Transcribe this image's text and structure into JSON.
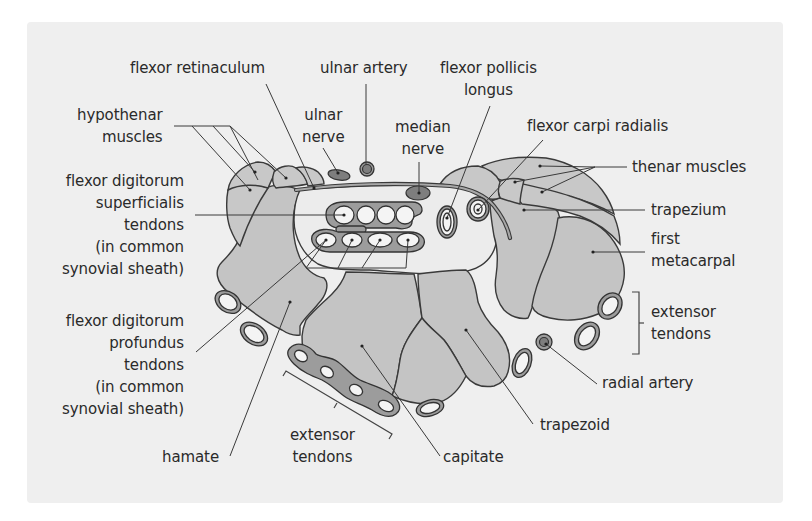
{
  "figure": {
    "colors": {
      "background": "#ffffff",
      "panel": "#efefef",
      "bone": "#c4c4c4",
      "tunnel_space": "#ececec",
      "sheath": "#9c9c9c",
      "nerve": "#7e7e7e",
      "outline": "#3a3a3a",
      "text": "#2a2a2a"
    }
  },
  "labels": {
    "flexor_retinaculum": "flexor retinaculum",
    "ulnar_artery": "ulnar artery",
    "flexor_pollicis_longus": "flexor pollicis\nlongus",
    "hypothenar_muscles": "hypothenar\nmuscles",
    "ulnar_nerve": "ulnar\nnerve",
    "median_nerve": "median\nnerve",
    "flexor_carpi_radialis": "flexor carpi radialis",
    "thenar_muscles": "thenar muscles",
    "fds_tendons": "flexor digitorum\nsuperficialis\ntendons\n(in common\nsynovial sheath)",
    "trapezium": "trapezium",
    "first_metacarpal": "first\nmetacarpal",
    "extensor_tendons_right": "extensor\ntendons",
    "fdp_tendons": "flexor digitorum\nprofundus\ntendons\n(in common\nsynovial sheath)",
    "radial_artery": "radial artery",
    "trapezoid": "trapezoid",
    "hamate": "hamate",
    "extensor_tendons_bottom": "extensor\ntendons",
    "capitate": "capitate"
  }
}
